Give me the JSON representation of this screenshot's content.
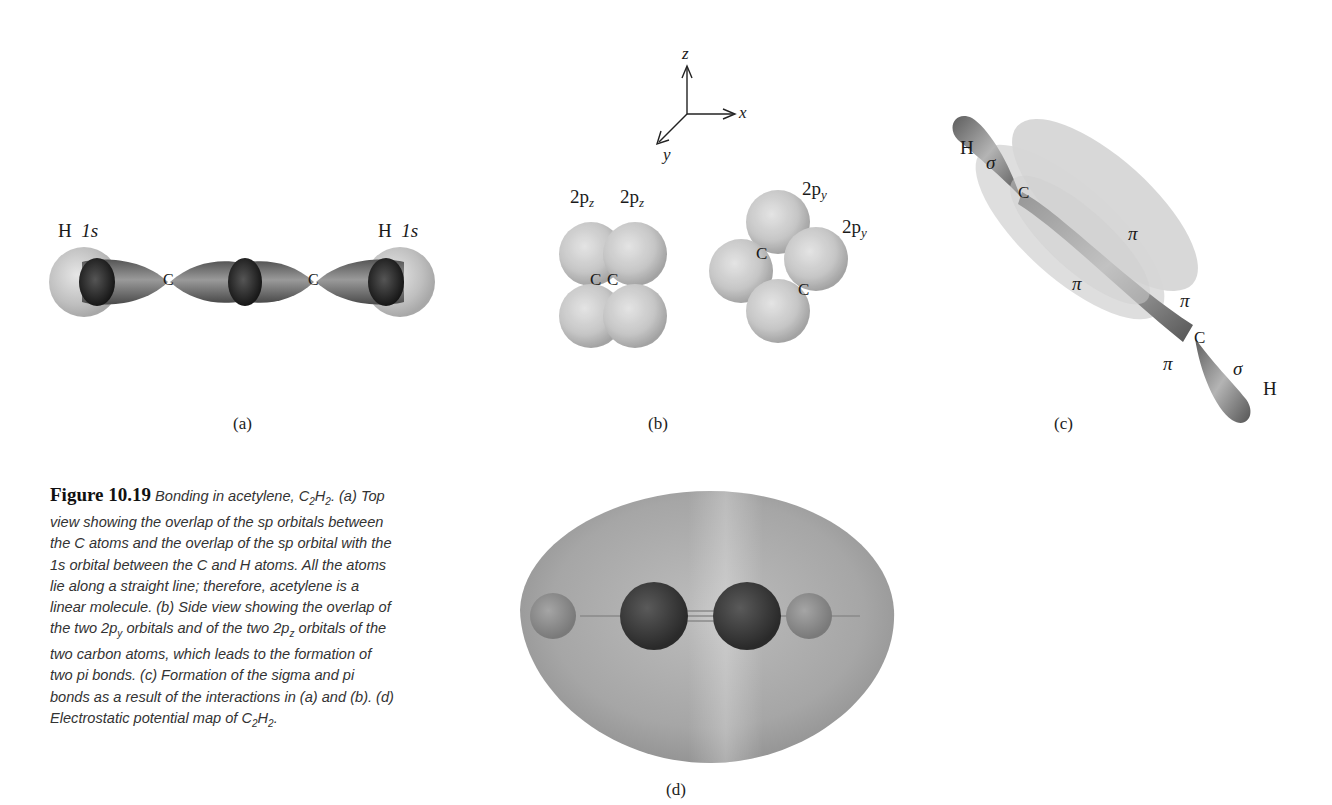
{
  "figure": {
    "number": "Figure 10.19",
    "caption_intro": "Bonding in acetylene,",
    "caption_formula": {
      "c": "C",
      "c_sub": "2",
      "h": "H",
      "h_sub": "2"
    },
    "caption_body": ". (a) Top view showing the overlap of the sp orbitals between the C atoms and the overlap of the sp orbital with the 1s orbital between the C and H atoms. All the atoms lie along a straight line; therefore, acetylene is a linear molecule. (b) Side view showing the overlap of the two 2p",
    "caption_py_sub": "y",
    "caption_body2": " orbitals and of the two 2p",
    "caption_pz_sub": "z",
    "caption_body3": " orbitals of the two carbon atoms, which leads to the formation of two pi bonds. (c) Formation of the sigma and pi bonds as a result of the interactions in (a) and (b). (d) Electrostatic potential map of ",
    "caption_end": "."
  },
  "panels": {
    "a": {
      "tag": "(a)",
      "h_left": "H",
      "h_left_orbital": "1s",
      "h_right": "H",
      "h_right_orbital": "1s",
      "c_left": "C",
      "c_right": "C"
    },
    "b": {
      "tag": "(b)",
      "axes": {
        "z": "z",
        "x": "x",
        "y": "y"
      },
      "left_labels": [
        "2p",
        "2p"
      ],
      "left_sub": "z",
      "right_labels": [
        "2p",
        "2p"
      ],
      "right_sub": "y",
      "c_label": "C"
    },
    "c": {
      "tag": "(c)",
      "h_top": "H",
      "h_bottom": "H",
      "sigma": "σ",
      "pi": "π",
      "c_label": "C"
    },
    "d": {
      "tag": "(d)"
    }
  }
}
